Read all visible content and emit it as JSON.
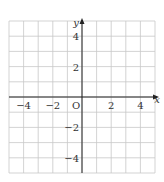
{
  "diagram": {
    "type": "coordinate-grid",
    "x_range": [
      -5,
      5
    ],
    "y_range": [
      -5,
      5
    ],
    "grid_step": 1,
    "axis_labels": {
      "x": "x",
      "y": "y"
    },
    "origin_label": "O",
    "x_ticks": [
      {
        "value": -4,
        "label": "−4"
      },
      {
        "value": -2,
        "label": "−2"
      },
      {
        "value": 2,
        "label": "2"
      },
      {
        "value": 4,
        "label": "4"
      }
    ],
    "y_ticks": [
      {
        "value": 4,
        "label": "4"
      },
      {
        "value": 2,
        "label": "2"
      },
      {
        "value": -2,
        "label": "−2"
      },
      {
        "value": -4,
        "label": "−4"
      }
    ],
    "colors": {
      "grid": "#c8c8c8",
      "axis": "#222222",
      "text": "#333333"
    }
  }
}
